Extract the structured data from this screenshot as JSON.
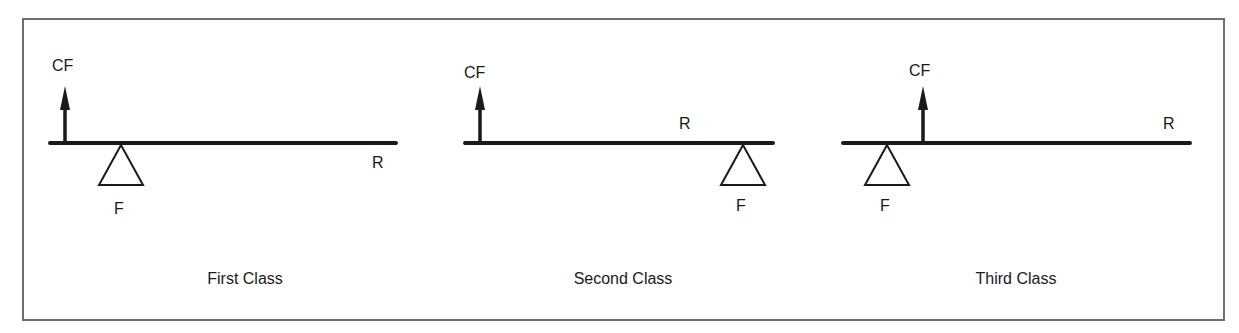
{
  "figure": {
    "border_color": "#6f6f6f",
    "ink_color": "#1a1a1a",
    "levers": [
      {
        "caption": "First Class",
        "labels": {
          "effort": "CF",
          "fulcrum": "F",
          "resistance": "R"
        },
        "beam": {
          "x1": 50,
          "x2": 396,
          "y": 143
        },
        "effort_arrow_x": 65,
        "fulcrum_x": 121,
        "resistance_label_pos": {
          "x": 372,
          "y": 155
        },
        "effort_label_pos": {
          "x": 52,
          "y": 58
        },
        "fulcrum_label_pos": {
          "x": 114,
          "y": 201
        },
        "caption_x": 245
      },
      {
        "caption": "Second Class",
        "labels": {
          "effort": "CF",
          "fulcrum": "F",
          "resistance": "R"
        },
        "beam": {
          "x1": 465,
          "x2": 773,
          "y": 143
        },
        "effort_arrow_x": 480,
        "fulcrum_x": 743,
        "resistance_label_pos": {
          "x": 679,
          "y": 116
        },
        "effort_label_pos": {
          "x": 464,
          "y": 65
        },
        "fulcrum_label_pos": {
          "x": 736,
          "y": 198
        },
        "caption_x": 623
      },
      {
        "caption": "Third Class",
        "labels": {
          "effort": "CF",
          "fulcrum": "F",
          "resistance": "R"
        },
        "beam": {
          "x1": 843,
          "x2": 1190,
          "y": 143
        },
        "effort_arrow_x": 923,
        "fulcrum_x": 887,
        "resistance_label_pos": {
          "x": 1163,
          "y": 116
        },
        "effort_label_pos": {
          "x": 909,
          "y": 63
        },
        "fulcrum_label_pos": {
          "x": 880,
          "y": 198
        },
        "caption_x": 1016
      }
    ]
  }
}
